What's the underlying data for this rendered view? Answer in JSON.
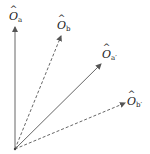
{
  "diagram": {
    "type": "vector-diagram",
    "origin": [
      15,
      149
    ],
    "colors": {
      "line": "#666666",
      "label": "#222222",
      "background": "#ffffff"
    },
    "vectors": [
      {
        "id": "a",
        "symbol": "O",
        "hat": "^",
        "subscript": "a",
        "style": "solid",
        "tip": [
          15,
          27
        ],
        "label_pos": [
          9,
          11
        ]
      },
      {
        "id": "b",
        "symbol": "O",
        "hat": "^",
        "subscript": "b",
        "style": "dashed",
        "tip": [
          61,
          36
        ],
        "label_pos": [
          57,
          20
        ]
      },
      {
        "id": "a_prime",
        "symbol": "O",
        "hat": "^",
        "subscript": "a′",
        "style": "solid",
        "tip": [
          101,
          64
        ],
        "label_pos": [
          102,
          49
        ]
      },
      {
        "id": "b_prime",
        "symbol": "O",
        "hat": "^",
        "subscript": "b′",
        "style": "dashed",
        "tip": [
          125,
          103
        ],
        "label_pos": [
          127,
          96
        ]
      }
    ]
  }
}
